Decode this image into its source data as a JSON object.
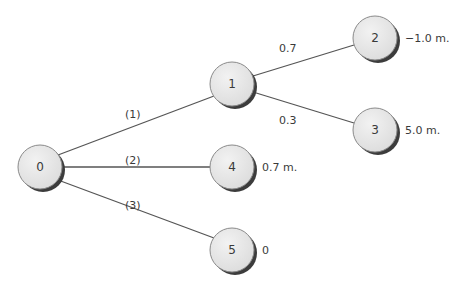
{
  "diagram": {
    "type": "decision-tree",
    "nodes": [
      {
        "id": "0",
        "label": "0",
        "cx": 40,
        "cy": 167,
        "value": ""
      },
      {
        "id": "1",
        "label": "1",
        "cx": 232,
        "cy": 84,
        "value": ""
      },
      {
        "id": "2",
        "label": "2",
        "cx": 375,
        "cy": 38,
        "value": "−1.0 m."
      },
      {
        "id": "3",
        "label": "3",
        "cx": 375,
        "cy": 130,
        "value": "5.0 m."
      },
      {
        "id": "4",
        "label": "4",
        "cx": 232,
        "cy": 167,
        "value": "0.7 m."
      },
      {
        "id": "5",
        "label": "5",
        "cx": 232,
        "cy": 250,
        "value": "0"
      }
    ],
    "edges": [
      {
        "from": "0",
        "to": "1",
        "label": "(1)"
      },
      {
        "from": "0",
        "to": "4",
        "label": "(2)"
      },
      {
        "from": "0",
        "to": "5",
        "label": "(3)"
      },
      {
        "from": "1",
        "to": "2",
        "label": "0.7"
      },
      {
        "from": "1",
        "to": "3",
        "label": "0.3"
      }
    ],
    "colors": {
      "node_fill": "#e6e6e6",
      "node_stroke": "#8a8a8a",
      "node_shadow": "#444444",
      "edge": "#555555",
      "text": "#3a3a3a"
    }
  }
}
